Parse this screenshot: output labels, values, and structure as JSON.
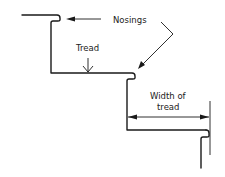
{
  "diagram": {
    "labels": {
      "nosings": "Nosings",
      "tread": "Tread",
      "width_line1": "Width of",
      "width_line2": "tread"
    },
    "colors": {
      "stroke": "#1a1a1a",
      "text": "#222222",
      "background": "#ffffff"
    }
  }
}
